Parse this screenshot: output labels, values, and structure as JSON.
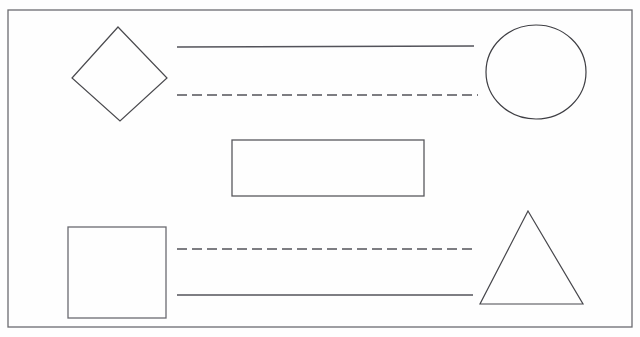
{
  "document": {
    "title": "Geometric Shapes Line Drawing",
    "canvas": {
      "width": 640,
      "height": 337
    },
    "background_color": "#fefefe",
    "ink_color": "#4a4a4e",
    "stroke_width": 1.2
  },
  "frame": {
    "name": "outer-border",
    "x": 8,
    "y": 10,
    "width": 624,
    "height": 317,
    "color": "#6b6b70"
  },
  "shapes": [
    {
      "id": "diamond",
      "kind": "polygon",
      "label": "Diamond",
      "points": "118,27 167,78 120,121 72,78",
      "color": "#4a4a4e"
    },
    {
      "id": "circle",
      "kind": "ellipse",
      "label": "Circle",
      "cx": 536,
      "cy": 72,
      "rx": 50,
      "ry": 47,
      "color": "#3f3f44"
    },
    {
      "id": "rectangle",
      "kind": "rect",
      "label": "Rectangle",
      "x": 232,
      "y": 140,
      "width": 192,
      "height": 56,
      "color": "#58585d"
    },
    {
      "id": "square",
      "kind": "rect",
      "label": "Square",
      "x": 68,
      "y": 227,
      "width": 98,
      "height": 91,
      "color": "#6a6a70"
    },
    {
      "id": "triangle",
      "kind": "polygon",
      "label": "Triangle",
      "points": "528,211 583,304 480,304",
      "color": "#47474c"
    }
  ],
  "lines": [
    {
      "id": "line-top-solid",
      "label": "Top solid line",
      "style": "solid",
      "x1": 177,
      "y1": 47,
      "x2": 474,
      "y2": 46,
      "color": "#53535a",
      "dash": "none"
    },
    {
      "id": "line-top-dashed",
      "label": "Top dashed line",
      "style": "dashed",
      "x1": 177,
      "y1": 95,
      "x2": 478,
      "y2": 95,
      "color": "#53535a",
      "dash": "10 5"
    },
    {
      "id": "line-bottom-dashed",
      "label": "Bottom dashed line",
      "style": "dashed",
      "x1": 177,
      "y1": 249,
      "x2": 476,
      "y2": 249,
      "color": "#53535a",
      "dash": "10 5"
    },
    {
      "id": "line-bottom-solid",
      "label": "Bottom solid line",
      "style": "solid",
      "x1": 177,
      "y1": 295,
      "x2": 473,
      "y2": 295,
      "color": "#53535a",
      "dash": "none"
    }
  ]
}
